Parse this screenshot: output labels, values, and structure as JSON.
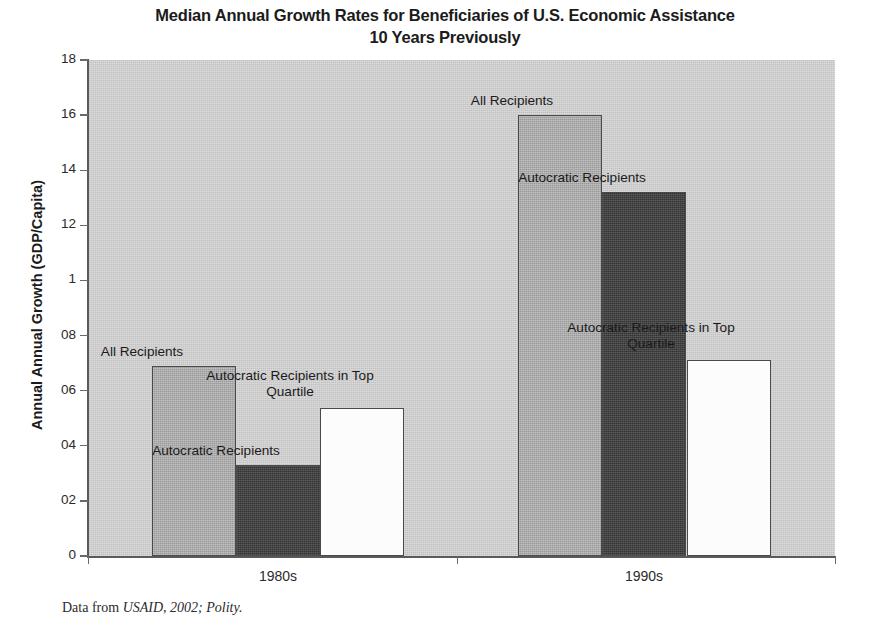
{
  "chart_data": {
    "type": "bar",
    "title": "Median Annual Growth Rates for Beneficiaries of U.S. Economic Assistance 10 Years Previously",
    "title_line1": "Median Annual Growth Rates for Beneficiaries of U.S. Economic Assistance",
    "title_line2": "10 Years Previously",
    "xlabel": "",
    "ylabel": "Annual Annual Growth (GDP/Capita)",
    "categories": [
      "1980s",
      "1990s"
    ],
    "ylim": [
      0,
      1.8
    ],
    "ytick_values": [
      1.8,
      1.6,
      1.4,
      1.2,
      1.0,
      0.8,
      0.6,
      0.4,
      0.2,
      0
    ],
    "ytick_labels": [
      "18",
      "16",
      "14",
      "12",
      "1",
      "08",
      "06",
      "04",
      "02",
      "0"
    ],
    "grid": false,
    "legend": "none (bars annotated in place)",
    "series": [
      {
        "name": "All Recipients",
        "color": "#a9a9a9",
        "values": [
          0.69,
          1.6
        ]
      },
      {
        "name": "Autocratic Recipients",
        "color": "#3f3f3f",
        "values": [
          0.33,
          1.32
        ]
      },
      {
        "name": "Autocratic Recipients in Top Quartile",
        "color": "#fcfcfc",
        "values": [
          0.537,
          0.71
        ]
      }
    ],
    "annotations": [
      {
        "text": "All Recipients",
        "group": "1980s",
        "series": "All Recipients"
      },
      {
        "text": "Autocratic Recipients",
        "group": "1980s",
        "series": "Autocratic Recipients"
      },
      {
        "text": "Autocratic Recipients in Top\nQuartile",
        "group": "1980s",
        "series": "Autocratic Recipients in Top Quartile"
      },
      {
        "text": "All Recipients",
        "group": "1990s",
        "series": "All Recipients"
      },
      {
        "text": "Autocratic Recipients",
        "group": "1990s",
        "series": "Autocratic Recipients"
      },
      {
        "text": "Autocratic Recipients in Top\nQuartile",
        "group": "1990s",
        "series": "Autocratic Recipients in Top Quartile"
      }
    ]
  },
  "source_note": {
    "prefix": "Data from ",
    "citation": "USAID, 2002; Polity."
  },
  "colors": {
    "plot_background": "#cdcdcd",
    "page_background": "#ffffff",
    "axis": "#5a5a5a",
    "text": "#1b1b1b",
    "bar_light": "#a9a9a9",
    "bar_dark": "#3f3f3f",
    "bar_white": "#fcfcfc"
  }
}
